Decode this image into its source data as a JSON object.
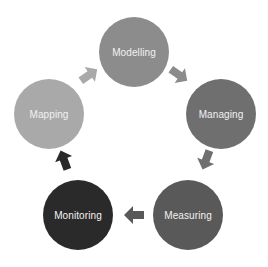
{
  "diagram": {
    "type": "cycle",
    "nodes": [
      {
        "id": "modelling",
        "label": "Modelling",
        "color": "#8c8c8c",
        "cx": 134,
        "cy": 52,
        "r": 35
      },
      {
        "id": "managing",
        "label": "Managing",
        "color": "#6f6f6f",
        "cx": 221,
        "cy": 114,
        "r": 35
      },
      {
        "id": "measuring",
        "label": "Measuring",
        "color": "#595959",
        "cx": 188,
        "cy": 215,
        "r": 35
      },
      {
        "id": "monitoring",
        "label": "Monitoring",
        "color": "#2a2a2a",
        "cx": 78,
        "cy": 215,
        "r": 35
      },
      {
        "id": "mapping",
        "label": "Mapping",
        "color": "#a9a9a9",
        "cx": 49,
        "cy": 114,
        "r": 35
      }
    ],
    "edges": [
      {
        "from": "modelling",
        "to": "managing"
      },
      {
        "from": "managing",
        "to": "measuring"
      },
      {
        "from": "measuring",
        "to": "monitoring"
      },
      {
        "from": "monitoring",
        "to": "mapping"
      },
      {
        "from": "mapping",
        "to": "modelling"
      }
    ]
  }
}
